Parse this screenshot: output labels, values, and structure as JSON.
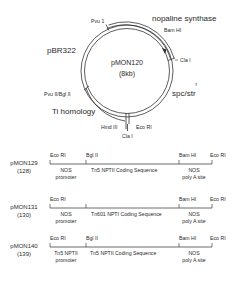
{
  "plasmid": {
    "name": "pMON120",
    "size": "(8kb)",
    "regions": {
      "nos": "nopaline synthase",
      "pbr": "pBR322",
      "spc": "spc/str",
      "spc_sup": "r",
      "ti": "Ti homology"
    },
    "sites": {
      "pvu1": "Pvu 1",
      "bamhi": "Bam HI",
      "clai_right": "Cla I",
      "pvu2bgl2": "Pvu II/Bgl II",
      "hind3": "Hind III",
      "ecori": "Eco RI",
      "clai_bottom": "Cla I"
    }
  },
  "constructs": [
    {
      "name": "pMON129",
      "number": "(128)",
      "sites": [
        "Eco RI",
        "Bgl II",
        "Bam HI",
        "Eco RI"
      ],
      "segments": {
        "promoter_line1": "NOS",
        "promoter_line2": "promoter",
        "coding": "Tn5   NPTII Coding Sequence",
        "poly_line1": "NOS",
        "poly_line2": "poly A site"
      }
    },
    {
      "name": "pMON131",
      "number": "(130)",
      "sites": [
        "Eco RI",
        "",
        "Bam HI",
        "Eco RI"
      ],
      "segments": {
        "promoter_line1": "NOS",
        "promoter_line2": "promoter",
        "coding": "Tn601 NPTI Coding Sequence",
        "poly_line1": "NOS",
        "poly_line2": "poly A site"
      }
    },
    {
      "name": "pMON140",
      "number": "(139)",
      "sites": [
        "Eco RI",
        "Bgl II",
        "Bam HI",
        "Eco RI"
      ],
      "segments": {
        "promoter_line1": "Tn5 NPTII",
        "promoter_line2": "promoter",
        "coding": "Tn5 NPTII Coding Sequence",
        "poly_line1": "NOS",
        "poly_line2": "poly A site"
      }
    }
  ]
}
